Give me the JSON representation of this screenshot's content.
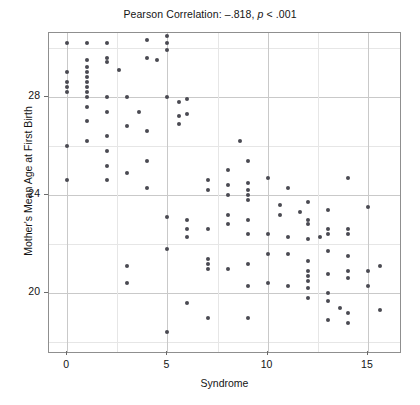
{
  "chart_data": {
    "type": "scatter",
    "title": "Pearson Correlation: –.818, p < .001",
    "title_parts": {
      "lead": "Pearson Correlation: –.818, ",
      "italic": "p",
      "tail": " < .001"
    },
    "xlabel": "Syndrome",
    "ylabel": "Mother's Mean Age at First Birth",
    "xlim": [
      -0.9,
      16.6
    ],
    "ylim": [
      17.6,
      30.6
    ],
    "xticks": [
      0,
      5,
      10,
      15
    ],
    "xtick_labels": [
      "0",
      "5",
      "10",
      "15"
    ],
    "yticks": [
      20,
      24,
      28
    ],
    "ytick_labels": [
      "20",
      "24",
      "28"
    ],
    "x_gridlines": [
      0,
      2.5,
      5,
      7.5,
      10,
      12.5,
      15
    ],
    "y_gridlines_major": [
      20,
      24,
      28
    ],
    "y_gridlines_minor": [
      18,
      22,
      26,
      30
    ],
    "grid": true,
    "legend": null,
    "marker_color": "#4a4a52",
    "frame_color": "#8f8f8f",
    "grid_color": "#c9c9c9",
    "points": [
      [
        0,
        30.2
      ],
      [
        0,
        29.0
      ],
      [
        0,
        28.6
      ],
      [
        0,
        28.4
      ],
      [
        0,
        28.2
      ],
      [
        0,
        26.0
      ],
      [
        0,
        24.6
      ],
      [
        1,
        30.2
      ],
      [
        1,
        29.5
      ],
      [
        1,
        29.2
      ],
      [
        1,
        29.0
      ],
      [
        1,
        28.8
      ],
      [
        1,
        28.6
      ],
      [
        1,
        28.4
      ],
      [
        1,
        28.2
      ],
      [
        1,
        28.0
      ],
      [
        1,
        27.6
      ],
      [
        1,
        27.0
      ],
      [
        1,
        26.2
      ],
      [
        2,
        30.2
      ],
      [
        2,
        29.6
      ],
      [
        2,
        29.4
      ],
      [
        2,
        28.0
      ],
      [
        2,
        27.4
      ],
      [
        2,
        26.4
      ],
      [
        2,
        25.8
      ],
      [
        2,
        25.2
      ],
      [
        2,
        24.6
      ],
      [
        2.6,
        29.1
      ],
      [
        3,
        28.0
      ],
      [
        3,
        26.8
      ],
      [
        3,
        24.9
      ],
      [
        3,
        21.1
      ],
      [
        3,
        20.4
      ],
      [
        3.6,
        27.4
      ],
      [
        4,
        30.3
      ],
      [
        4,
        29.6
      ],
      [
        4,
        26.6
      ],
      [
        4,
        25.4
      ],
      [
        4,
        24.3
      ],
      [
        4.5,
        29.5
      ],
      [
        5,
        30.5
      ],
      [
        5,
        30.2
      ],
      [
        5,
        29.9
      ],
      [
        5,
        28.0
      ],
      [
        5,
        23.1
      ],
      [
        5,
        21.8
      ],
      [
        5,
        18.4
      ],
      [
        5.6,
        27.8
      ],
      [
        5.6,
        27.2
      ],
      [
        5.6,
        26.9
      ],
      [
        6,
        27.9
      ],
      [
        6,
        27.3
      ],
      [
        6,
        23.0
      ],
      [
        6,
        22.6
      ],
      [
        6,
        22.3
      ],
      [
        6,
        19.6
      ],
      [
        7,
        24.6
      ],
      [
        7,
        24.2
      ],
      [
        7,
        22.6
      ],
      [
        7,
        21.4
      ],
      [
        7,
        21.2
      ],
      [
        7,
        21.0
      ],
      [
        7,
        19.0
      ],
      [
        8,
        25.0
      ],
      [
        8,
        24.4
      ],
      [
        8,
        24.0
      ],
      [
        8,
        23.2
      ],
      [
        8,
        22.8
      ],
      [
        8,
        21.0
      ],
      [
        8.6,
        26.2
      ],
      [
        9,
        25.4
      ],
      [
        9,
        24.5
      ],
      [
        9,
        24.2
      ],
      [
        9,
        24.0
      ],
      [
        9,
        23.8
      ],
      [
        9,
        23.0
      ],
      [
        9,
        22.4
      ],
      [
        9,
        21.2
      ],
      [
        9,
        20.3
      ],
      [
        9,
        19.0
      ],
      [
        10,
        24.7
      ],
      [
        10,
        22.4
      ],
      [
        10,
        21.6
      ],
      [
        10,
        20.4
      ],
      [
        10.6,
        23.6
      ],
      [
        10.6,
        23.2
      ],
      [
        11,
        24.3
      ],
      [
        11,
        22.3
      ],
      [
        11,
        21.6
      ],
      [
        11,
        20.3
      ],
      [
        11.6,
        23.3
      ],
      [
        12,
        23.7
      ],
      [
        12,
        23.0
      ],
      [
        12,
        22.8
      ],
      [
        12,
        22.2
      ],
      [
        12,
        21.3
      ],
      [
        12,
        20.9
      ],
      [
        12,
        20.7
      ],
      [
        12,
        20.5
      ],
      [
        12,
        20.2
      ],
      [
        12,
        19.8
      ],
      [
        12.6,
        22.3
      ],
      [
        13,
        23.4
      ],
      [
        13,
        22.6
      ],
      [
        13,
        22.4
      ],
      [
        13,
        21.7
      ],
      [
        13,
        20.8
      ],
      [
        13,
        20.0
      ],
      [
        13,
        19.7
      ],
      [
        13,
        18.9
      ],
      [
        13.6,
        19.4
      ],
      [
        14,
        24.7
      ],
      [
        14,
        22.6
      ],
      [
        14,
        22.4
      ],
      [
        14,
        21.5
      ],
      [
        14,
        20.9
      ],
      [
        14,
        20.6
      ],
      [
        14,
        19.2
      ],
      [
        14,
        18.8
      ],
      [
        15,
        23.5
      ],
      [
        15,
        20.9
      ],
      [
        15,
        20.3
      ],
      [
        15.6,
        21.1
      ],
      [
        15.6,
        19.3
      ]
    ]
  }
}
